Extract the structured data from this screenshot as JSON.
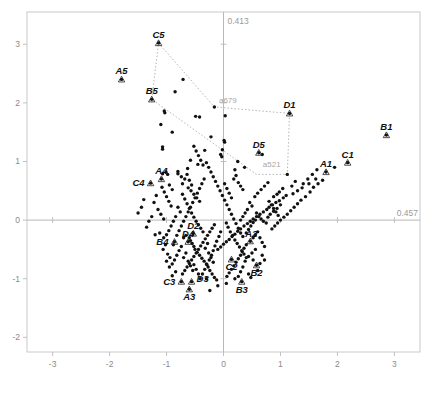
{
  "chart_data": {
    "type": "scatter",
    "title": "",
    "subtitle": "",
    "xlabel": "",
    "ylabel": "",
    "xlim": [
      -3.45,
      3.45
    ],
    "ylim": [
      -2.25,
      3.55
    ],
    "grid": false,
    "legend": "none",
    "x_ticks": [
      "-3",
      "-2",
      "-1",
      "0",
      "1",
      "2",
      "3"
    ],
    "x_tick_values": [
      -3,
      -2,
      -1,
      0,
      1,
      2,
      3
    ],
    "y_ticks": [
      "3",
      "2",
      "1",
      "0",
      "-1",
      "-2"
    ],
    "y_tick_values": [
      3,
      2,
      1,
      0,
      -1,
      -2
    ],
    "axis_annotations": {
      "vertical_axis_value": "0.413",
      "horizontal_axis_value": "0.457"
    },
    "gray_labels": [
      {
        "text": "a679",
        "x": -0.15,
        "y": 1.95
      },
      {
        "text": "a521",
        "x": 0.62,
        "y": 0.86
      }
    ],
    "labeled_points": [
      {
        "label": "C5",
        "x": -1.14,
        "y": 3.02
      },
      {
        "label": "A5",
        "x": -1.79,
        "y": 2.4
      },
      {
        "label": "B5",
        "x": -1.26,
        "y": 2.06
      },
      {
        "label": "D1",
        "x": 1.16,
        "y": 1.82
      },
      {
        "label": "B1",
        "x": 2.86,
        "y": 1.45
      },
      {
        "label": "D5",
        "x": 0.62,
        "y": 1.15
      },
      {
        "label": "C1",
        "x": 2.18,
        "y": 0.98
      },
      {
        "label": "A1",
        "x": 1.8,
        "y": 0.82
      },
      {
        "label": "A4",
        "x": -1.09,
        "y": 0.7
      },
      {
        "label": "C4",
        "x": -1.28,
        "y": 0.63
      },
      {
        "label": "D2",
        "x": -0.53,
        "y": -0.23
      },
      {
        "label": "D4",
        "x": -0.62,
        "y": -0.37
      },
      {
        "label": "B4",
        "x": -0.86,
        "y": -0.37
      },
      {
        "label": "A2",
        "x": 0.47,
        "y": -0.36
      },
      {
        "label": "C2",
        "x": 0.14,
        "y": -0.67
      },
      {
        "label": "B2",
        "x": 0.58,
        "y": -0.77
      },
      {
        "label": "C3",
        "x": -0.74,
        "y": -1.05
      },
      {
        "label": "D3",
        "x": -0.56,
        "y": -1.05
      },
      {
        "label": "A3",
        "x": -0.6,
        "y": -1.18
      },
      {
        "label": "B3",
        "x": 0.32,
        "y": -1.05
      }
    ],
    "hull_polygon": [
      {
        "x": -1.14,
        "y": 3.02
      },
      {
        "x": -0.16,
        "y": 1.93
      },
      {
        "x": 1.16,
        "y": 1.82
      },
      {
        "x": 1.12,
        "y": 0.78
      },
      {
        "x": 0.58,
        "y": 0.78
      },
      {
        "x": -1.26,
        "y": 2.06
      }
    ],
    "points": [
      [
        -1.14,
        3.02
      ],
      [
        -1.79,
        2.4
      ],
      [
        -1.26,
        2.06
      ],
      [
        -0.71,
        2.4
      ],
      [
        -0.85,
        2.19
      ],
      [
        -0.16,
        1.93
      ],
      [
        -1.04,
        1.86
      ],
      [
        -1.03,
        1.83
      ],
      [
        -1.1,
        1.63
      ],
      [
        -0.49,
        1.77
      ],
      [
        -0.42,
        1.76
      ],
      [
        0.03,
        1.78
      ],
      [
        -0.9,
        1.5
      ],
      [
        -1.07,
        1.25
      ],
      [
        -1.07,
        1.21
      ],
      [
        -0.22,
        1.42
      ],
      [
        0.01,
        1.36
      ],
      [
        0.02,
        1.33
      ],
      [
        -0.33,
        1.19
      ],
      [
        -0.02,
        1.2
      ],
      [
        -0.05,
        1.12
      ],
      [
        -0.03,
        1.08
      ],
      [
        -0.58,
        1.02
      ],
      [
        -0.45,
        0.95
      ],
      [
        -1.07,
        0.79
      ],
      [
        -1.01,
        0.82
      ],
      [
        -0.98,
        0.78
      ],
      [
        -0.8,
        0.83
      ],
      [
        -0.8,
        0.79
      ],
      [
        -0.74,
        0.74
      ],
      [
        -0.63,
        0.88
      ],
      [
        0.25,
        1.0
      ],
      [
        0.2,
        0.86
      ],
      [
        0.37,
        0.9
      ],
      [
        0.62,
        1.15
      ],
      [
        0.68,
        1.12
      ],
      [
        1.16,
        1.82
      ],
      [
        1.12,
        0.78
      ],
      [
        1.8,
        0.82
      ],
      [
        2.18,
        0.98
      ],
      [
        2.86,
        1.45
      ],
      [
        1.95,
        0.9
      ],
      [
        1.62,
        0.7
      ],
      [
        1.5,
        0.62
      ],
      [
        1.38,
        0.55
      ],
      [
        1.3,
        0.5
      ],
      [
        1.22,
        0.45
      ],
      [
        1.1,
        0.42
      ],
      [
        1.05,
        0.38
      ],
      [
        0.98,
        0.33
      ],
      [
        0.92,
        0.3
      ],
      [
        0.86,
        0.26
      ],
      [
        0.8,
        0.22
      ],
      [
        0.76,
        0.18
      ],
      [
        0.7,
        0.14
      ],
      [
        0.64,
        0.1
      ],
      [
        0.58,
        0.06
      ],
      [
        0.52,
        0.02
      ],
      [
        0.47,
        -0.02
      ],
      [
        0.42,
        -0.06
      ],
      [
        0.36,
        -0.1
      ],
      [
        0.3,
        -0.15
      ],
      [
        0.25,
        -0.19
      ],
      [
        0.2,
        -0.24
      ],
      [
        0.15,
        -0.28
      ],
      [
        0.1,
        -0.33
      ],
      [
        0.05,
        -0.37
      ],
      [
        0.0,
        -0.41
      ],
      [
        -0.05,
        -0.46
      ],
      [
        -0.1,
        -0.5
      ],
      [
        -0.62,
        0.55
      ],
      [
        -0.57,
        0.5
      ],
      [
        -0.52,
        0.44
      ],
      [
        -0.47,
        0.38
      ],
      [
        -0.42,
        0.32
      ],
      [
        -0.72,
        0.44
      ],
      [
        -0.68,
        0.36
      ],
      [
        -0.64,
        0.28
      ],
      [
        -0.6,
        0.2
      ],
      [
        -0.56,
        0.12
      ],
      [
        -0.52,
        0.05
      ],
      [
        -0.48,
        -0.02
      ],
      [
        -0.44,
        -0.08
      ],
      [
        -0.4,
        -0.14
      ],
      [
        -0.36,
        -0.2
      ],
      [
        -0.8,
        0.22
      ],
      [
        -0.76,
        0.14
      ],
      [
        -0.84,
        0.06
      ],
      [
        -0.88,
        -0.02
      ],
      [
        -0.92,
        -0.1
      ],
      [
        -0.96,
        -0.18
      ],
      [
        -1.0,
        -0.25
      ],
      [
        -1.05,
        -0.3
      ],
      [
        -1.12,
        -0.22
      ],
      [
        -1.2,
        -0.25
      ],
      [
        -1.26,
        0.06
      ],
      [
        -1.28,
        0.63
      ],
      [
        -1.09,
        0.7
      ],
      [
        -1.31,
        -0.02
      ],
      [
        -1.35,
        -0.12
      ],
      [
        -0.53,
        -0.23
      ],
      [
        -0.62,
        -0.37
      ],
      [
        -0.86,
        -0.37
      ],
      [
        -0.7,
        -0.3
      ],
      [
        -0.66,
        -0.26
      ],
      [
        -0.6,
        -0.3
      ],
      [
        -0.58,
        -0.35
      ],
      [
        -0.55,
        -0.4
      ],
      [
        -0.52,
        -0.45
      ],
      [
        -0.5,
        -0.5
      ],
      [
        -0.46,
        -0.55
      ],
      [
        -0.42,
        -0.6
      ],
      [
        -0.38,
        -0.65
      ],
      [
        -0.34,
        -0.7
      ],
      [
        -0.3,
        -0.75
      ],
      [
        -0.27,
        -0.8
      ],
      [
        -0.24,
        -0.86
      ],
      [
        -0.2,
        -0.92
      ],
      [
        -0.16,
        -0.98
      ],
      [
        -0.12,
        -1.02
      ],
      [
        -0.74,
        -0.45
      ],
      [
        -0.78,
        -0.52
      ],
      [
        -0.82,
        -0.6
      ],
      [
        -0.86,
        -0.68
      ],
      [
        -0.9,
        -0.75
      ],
      [
        -0.74,
        -1.05
      ],
      [
        -0.56,
        -1.05
      ],
      [
        -0.6,
        -1.18
      ],
      [
        0.32,
        -1.05
      ],
      [
        0.14,
        -0.67
      ],
      [
        0.58,
        -0.77
      ],
      [
        0.47,
        -0.36
      ],
      [
        0.4,
        -0.42
      ],
      [
        0.36,
        -0.48
      ],
      [
        0.33,
        -0.54
      ],
      [
        0.3,
        -0.6
      ],
      [
        0.26,
        -0.66
      ],
      [
        0.22,
        -0.72
      ],
      [
        0.18,
        -0.78
      ],
      [
        0.14,
        -0.84
      ],
      [
        0.1,
        -0.9
      ],
      [
        0.06,
        -0.96
      ],
      [
        0.52,
        -0.3
      ],
      [
        0.56,
        -0.25
      ],
      [
        0.6,
        -0.2
      ],
      [
        0.64,
        -0.3
      ],
      [
        0.68,
        -0.38
      ],
      [
        0.72,
        -0.45
      ],
      [
        0.56,
        -0.5
      ],
      [
        0.5,
        -0.56
      ],
      [
        0.44,
        -0.62
      ],
      [
        0.38,
        -0.7
      ],
      [
        0.34,
        -0.8
      ],
      [
        0.3,
        -0.88
      ],
      [
        0.26,
        -0.96
      ],
      [
        0.85,
        -0.15
      ],
      [
        0.9,
        -0.1
      ],
      [
        0.95,
        -0.05
      ],
      [
        1.0,
        0.0
      ],
      [
        1.06,
        0.05
      ],
      [
        1.12,
        0.1
      ],
      [
        1.18,
        0.16
      ],
      [
        1.24,
        0.22
      ],
      [
        1.3,
        0.28
      ],
      [
        1.36,
        0.34
      ],
      [
        1.44,
        0.4
      ],
      [
        1.52,
        0.48
      ],
      [
        1.58,
        0.56
      ],
      [
        1.66,
        0.62
      ],
      [
        1.74,
        0.68
      ],
      [
        0.78,
        0.05
      ],
      [
        0.82,
        0.1
      ],
      [
        0.88,
        0.15
      ],
      [
        0.94,
        0.2
      ],
      [
        1.0,
        0.26
      ],
      [
        0.75,
        -0.05
      ],
      [
        0.7,
        -0.02
      ],
      [
        0.66,
        0.02
      ],
      [
        0.62,
        0.06
      ],
      [
        0.58,
        0.12
      ],
      [
        -0.22,
        0.82
      ],
      [
        -0.18,
        0.74
      ],
      [
        -0.14,
        0.66
      ],
      [
        -0.1,
        0.58
      ],
      [
        -0.06,
        0.5
      ],
      [
        -0.02,
        0.42
      ],
      [
        0.02,
        0.34
      ],
      [
        0.06,
        0.26
      ],
      [
        0.1,
        0.18
      ],
      [
        0.14,
        0.1
      ],
      [
        0.18,
        0.02
      ],
      [
        0.22,
        -0.06
      ],
      [
        0.26,
        -0.14
      ],
      [
        0.3,
        -0.22
      ],
      [
        0.34,
        -0.28
      ],
      [
        -0.3,
        0.98
      ],
      [
        -0.26,
        0.9
      ],
      [
        -0.34,
        0.7
      ],
      [
        -0.38,
        0.62
      ],
      [
        -0.42,
        0.54
      ],
      [
        -0.46,
        0.46
      ],
      [
        -0.5,
        0.38
      ],
      [
        -0.54,
        0.3
      ],
      [
        -0.58,
        0.22
      ],
      [
        -0.62,
        0.14
      ],
      [
        -0.66,
        0.06
      ],
      [
        -0.7,
        -0.02
      ],
      [
        -0.74,
        -0.1
      ],
      [
        -0.78,
        -0.18
      ],
      [
        -0.82,
        -0.26
      ],
      [
        0.02,
        0.62
      ],
      [
        0.06,
        0.54
      ],
      [
        0.1,
        0.46
      ],
      [
        0.14,
        0.38
      ],
      [
        0.46,
        0.3
      ],
      [
        0.5,
        0.24
      ],
      [
        0.42,
        0.18
      ],
      [
        0.38,
        0.12
      ],
      [
        0.34,
        0.06
      ],
      [
        0.3,
        0.0
      ],
      [
        -0.16,
        -0.08
      ],
      [
        -0.2,
        -0.14
      ],
      [
        -0.24,
        -0.2
      ],
      [
        -0.28,
        -0.26
      ],
      [
        -0.32,
        -0.32
      ],
      [
        -0.36,
        -0.38
      ],
      [
        -0.4,
        -0.44
      ],
      [
        -0.44,
        -0.5
      ],
      [
        -0.48,
        -0.56
      ],
      [
        -0.52,
        -0.62
      ],
      [
        -0.56,
        -0.68
      ],
      [
        -0.6,
        -0.74
      ],
      [
        -0.64,
        -0.8
      ],
      [
        -0.68,
        -0.86
      ],
      [
        -0.72,
        -0.92
      ],
      [
        -1.18,
        0.42
      ],
      [
        -1.22,
        0.3
      ],
      [
        -1.15,
        0.18
      ],
      [
        -1.1,
        0.1
      ],
      [
        -1.05,
        0.02
      ],
      [
        -1.4,
        0.35
      ],
      [
        -1.44,
        0.22
      ],
      [
        -1.5,
        0.12
      ],
      [
        -0.95,
        0.6
      ],
      [
        -0.9,
        0.52
      ],
      [
        0.05,
        -0.05
      ],
      [
        0.08,
        -0.12
      ],
      [
        0.12,
        -0.2
      ],
      [
        0.16,
        -0.26
      ],
      [
        0.2,
        -0.34
      ],
      [
        0.24,
        -0.4
      ],
      [
        0.28,
        -0.46
      ],
      [
        0.32,
        -0.52
      ],
      [
        0.36,
        -0.58
      ],
      [
        0.4,
        -0.64
      ],
      [
        -0.05,
        -0.2
      ],
      [
        -0.08,
        -0.28
      ],
      [
        -0.12,
        -0.36
      ],
      [
        -0.15,
        -0.44
      ],
      [
        -0.18,
        -0.52
      ],
      [
        -0.21,
        -0.6
      ],
      [
        -0.25,
        -0.68
      ],
      [
        -0.29,
        -0.76
      ],
      [
        -0.33,
        -0.84
      ],
      [
        -0.37,
        -0.92
      ],
      [
        -0.41,
        -1.0
      ],
      [
        -0.9,
        -0.95
      ],
      [
        -0.84,
        -0.88
      ],
      [
        -0.95,
        -0.8
      ],
      [
        -1.0,
        -0.7
      ],
      [
        0.44,
        -0.92
      ],
      [
        0.48,
        -0.98
      ],
      [
        0.2,
        -1.0
      ],
      [
        0.05,
        -1.08
      ],
      [
        -0.1,
        -1.12
      ],
      [
        -0.24,
        -1.2
      ],
      [
        -0.44,
        -0.92
      ],
      [
        -0.48,
        -0.84
      ],
      [
        -0.52,
        -0.76
      ],
      [
        -0.3,
        -1.0
      ],
      [
        1.4,
        0.62
      ],
      [
        1.48,
        0.7
      ],
      [
        1.56,
        0.78
      ],
      [
        1.64,
        0.86
      ],
      [
        1.2,
        0.58
      ],
      [
        1.26,
        0.66
      ],
      [
        0.98,
        0.48
      ],
      [
        1.04,
        0.54
      ],
      [
        0.88,
        0.4
      ],
      [
        0.94,
        0.44
      ],
      [
        -0.72,
        0.62
      ],
      [
        -0.68,
        0.7
      ],
      [
        -0.64,
        0.78
      ],
      [
        -0.6,
        0.68
      ],
      [
        -0.56,
        0.6
      ],
      [
        0.55,
        0.4
      ],
      [
        0.6,
        0.46
      ],
      [
        0.66,
        0.52
      ],
      [
        0.72,
        0.58
      ],
      [
        0.78,
        0.64
      ],
      [
        -0.92,
        0.24
      ],
      [
        -0.96,
        0.32
      ],
      [
        -1.0,
        0.4
      ],
      [
        -1.04,
        0.48
      ],
      [
        -1.08,
        0.56
      ],
      [
        0.18,
        0.7
      ],
      [
        0.22,
        0.76
      ],
      [
        0.26,
        0.64
      ],
      [
        0.3,
        0.58
      ],
      [
        0.34,
        0.52
      ],
      [
        -0.44,
        1.1
      ],
      [
        -0.4,
        1.02
      ],
      [
        -0.36,
        0.94
      ],
      [
        -0.48,
        1.18
      ],
      [
        -0.52,
        1.26
      ],
      [
        0.8,
        0.32
      ],
      [
        0.84,
        0.26
      ],
      [
        0.88,
        0.2
      ],
      [
        0.92,
        0.14
      ],
      [
        0.96,
        0.08
      ],
      [
        -1.02,
        -0.42
      ],
      [
        -1.06,
        -0.5
      ],
      [
        -0.98,
        -0.58
      ],
      [
        -0.94,
        -0.64
      ],
      [
        -0.88,
        -0.42
      ],
      [
        0.68,
        -0.6
      ],
      [
        0.72,
        -0.68
      ],
      [
        0.64,
        -0.74
      ],
      [
        0.6,
        -0.86
      ],
      [
        0.52,
        -0.68
      ],
      [
        -0.66,
        -0.56
      ],
      [
        -0.7,
        -0.64
      ],
      [
        -0.62,
        -0.7
      ],
      [
        -0.58,
        -0.78
      ],
      [
        -0.54,
        -0.86
      ],
      [
        0.4,
        -0.22
      ],
      [
        0.44,
        -0.16
      ],
      [
        0.48,
        -0.1
      ],
      [
        0.52,
        -0.04
      ],
      [
        0.56,
        0.0
      ],
      [
        -0.28,
        -0.4
      ],
      [
        -0.32,
        -0.48
      ],
      [
        -0.26,
        -0.56
      ],
      [
        -0.22,
        -0.64
      ],
      [
        -0.18,
        -0.72
      ]
    ]
  }
}
